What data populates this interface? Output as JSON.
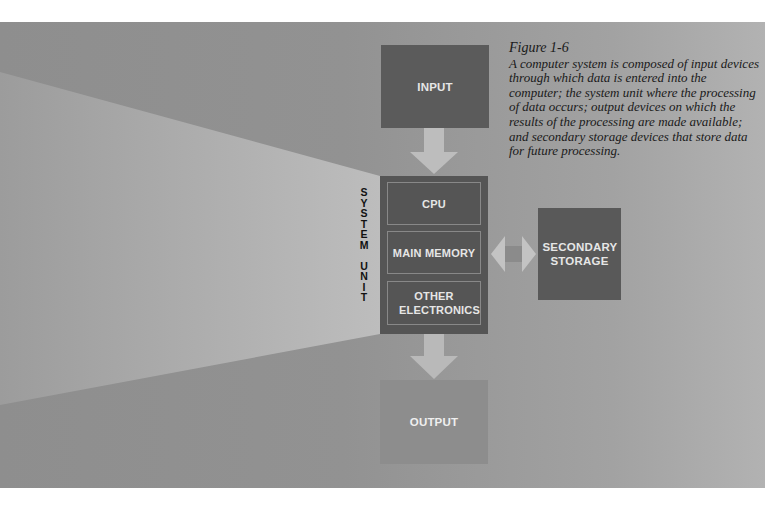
{
  "figure": {
    "number": "Figure 1-6",
    "caption": "A computer system is composed of input devices through which data is entered into the computer; the system unit where the processing of data occurs; output devices on which the results of the processing are made available; and secondary storage devices that store data for future processing."
  },
  "diagram": {
    "input": {
      "label": "INPUT"
    },
    "system_unit": {
      "vertical_label": "S\nY\nS\nT\nE\nM\n\nU\nN\nI\nT",
      "components": [
        {
          "label": "CPU"
        },
        {
          "label": "MAIN MEMORY"
        },
        {
          "label": "OTHER ELECTRONICS"
        }
      ]
    },
    "secondary_storage": {
      "label": "SECONDARY STORAGE"
    },
    "output": {
      "label": "OUTPUT"
    },
    "connections": [
      {
        "from": "INPUT",
        "to": "SYSTEM UNIT",
        "direction": "down"
      },
      {
        "from": "SYSTEM UNIT",
        "to": "OUTPUT",
        "direction": "down"
      },
      {
        "from": "MAIN MEMORY",
        "to": "SECONDARY STORAGE",
        "direction": "bidirectional"
      }
    ]
  },
  "colors": {
    "background_panel": "#929292",
    "dark_box": "#575757",
    "output_box": "#8d8d8d",
    "arrow": "#c4c4c4",
    "beam": "#b8b8b8"
  }
}
